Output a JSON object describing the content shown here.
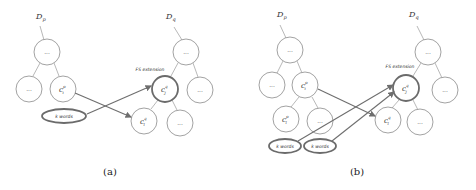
{
  "panels": [
    {
      "id": "a",
      "caption": "(a)",
      "source_tree_label": "D",
      "source_tree_sub": "p",
      "target_tree_label": "D",
      "target_tree_sub": "q",
      "fs_label": "FS extension",
      "ellipsis": "...",
      "concept_source": {
        "base": "c",
        "sub": "i",
        "sup": "p"
      },
      "concept_target": {
        "base": "c",
        "sub": "j",
        "sup": "q"
      },
      "concept_other": {
        "base": "c",
        "sub": "l",
        "sup": "q"
      },
      "kwords": [
        "k words"
      ]
    },
    {
      "id": "b",
      "caption": "(b)",
      "source_tree_label": "D",
      "source_tree_sub": "p",
      "target_tree_label": "D",
      "target_tree_sub": "q",
      "fs_label": "FS extension",
      "ellipsis": "...",
      "concept_source": {
        "base": "c",
        "sub": "i",
        "sup": "p"
      },
      "concept_source_child": {
        "base": "c",
        "sub": "l",
        "sup": "p"
      },
      "concept_target": {
        "base": "c",
        "sub": "j",
        "sup": "q"
      },
      "concept_other": {
        "base": "c",
        "sub": "l",
        "sup": "q"
      },
      "kwords": [
        "k words",
        "k words"
      ]
    }
  ]
}
